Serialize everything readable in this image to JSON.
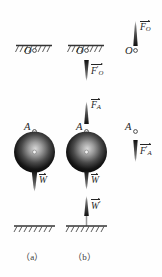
{
  "figure": {
    "type": "physics-free-body-diagram",
    "title": "",
    "captions": [
      {
        "id": "a",
        "text": "（a）"
      },
      {
        "id": "b",
        "text": "（b）"
      }
    ],
    "colors": {
      "ink": "#242424",
      "rope": "#8f8f8f",
      "hatch": "#555555",
      "sphere_dark": "#0d0d0d",
      "sphere_light": "#cfcfcf",
      "arrow": "#1a1a1a",
      "background": "#fefefe"
    },
    "points": [
      {
        "name": "O",
        "label": "O",
        "panels": [
          "a",
          "b",
          "c"
        ]
      },
      {
        "name": "A",
        "label": "A",
        "panels": [
          "a",
          "b",
          "c"
        ]
      }
    ],
    "panels": [
      {
        "id": "a",
        "name": "panel-a-ball-on-rope",
        "has_ceiling_support": true,
        "has_ground_hatch": true,
        "has_sphere": true,
        "point_labels": [
          "O",
          "A"
        ],
        "vectors": [
          {
            "name": "weight",
            "symbol": "W",
            "prime": false,
            "subscript": "",
            "direction": "down",
            "label": "W"
          }
        ]
      },
      {
        "id": "b",
        "name": "panel-b-forces-on-rope-and-ball",
        "has_ceiling_support": true,
        "has_ground_hatch": true,
        "has_sphere": true,
        "point_labels": [
          "O",
          "A"
        ],
        "vectors": [
          {
            "name": "reaction-at-O",
            "symbol": "F",
            "prime": true,
            "subscript": "O",
            "direction": "down",
            "label": "F'O"
          },
          {
            "name": "tension-at-A",
            "symbol": "F",
            "prime": false,
            "subscript": "A",
            "direction": "up",
            "label": "FA"
          },
          {
            "name": "weight",
            "symbol": "W",
            "prime": false,
            "subscript": "",
            "direction": "down",
            "label": "W"
          },
          {
            "name": "weight-reaction",
            "symbol": "W",
            "prime": true,
            "subscript": "",
            "direction": "up",
            "label": "W'"
          }
        ]
      },
      {
        "id": "c",
        "name": "panel-c-isolated-rope",
        "has_ceiling_support": false,
        "has_ground_hatch": false,
        "has_sphere": false,
        "point_labels": [
          "O",
          "A"
        ],
        "vectors": [
          {
            "name": "force-at-O",
            "symbol": "F",
            "prime": false,
            "subscript": "O",
            "direction": "up",
            "label": "FO"
          },
          {
            "name": "reaction-at-A",
            "symbol": "F",
            "prime": true,
            "subscript": "A",
            "direction": "down",
            "label": "F'A"
          }
        ]
      }
    ],
    "labels": {
      "O": "O",
      "A": "A",
      "F": "F",
      "W": "W",
      "sub_O": "O",
      "sub_A": "A",
      "prime": "′"
    }
  }
}
